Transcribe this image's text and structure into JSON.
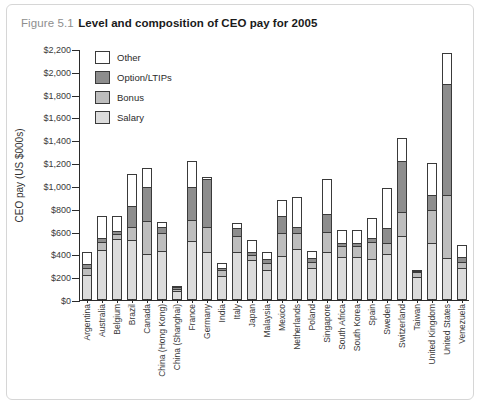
{
  "figure": {
    "number": "Figure 5.1",
    "title": "Level and composition of CEO pay for 2005"
  },
  "chart_data": {
    "type": "bar",
    "stacked": true,
    "title": "Level and composition of CEO pay for 2005",
    "xlabel": "",
    "ylabel": "CEO pay (US $000s)",
    "ylim": [
      0,
      2200
    ],
    "ytick_step": 200,
    "ytick_labels": [
      "$0",
      "$200",
      "$400",
      "$600",
      "$800",
      "$1,000",
      "$1,200",
      "$1,400",
      "$1,600",
      "$1,800",
      "$2,000",
      "$2,200"
    ],
    "grid": false,
    "legend_position": "top-left",
    "legend": [
      "Other",
      "Option/LTIPs",
      "Bonus",
      "Salary"
    ],
    "colors": {
      "Other": "#ffffff",
      "Option/LTIPs": "#8d8d8d",
      "Bonus": "#bdbdbd",
      "Salary": "#dcdcdc"
    },
    "categories": [
      "Argentina",
      "Australia",
      "Belgium",
      "Brazil",
      "Canada",
      "China (Hong Kong)",
      "China (Shanghai)",
      "France",
      "Germany",
      "India",
      "Italy",
      "Japan",
      "Malaysia",
      "Mexico",
      "Netherlands",
      "Poland",
      "Singapore",
      "South Africa",
      "South Korea",
      "Spain",
      "Sweden",
      "Switzerland",
      "Taiwan",
      "United Kingdom",
      "United States",
      "Venezuela"
    ],
    "series": [
      {
        "name": "Salary",
        "values": [
          205,
          420,
          520,
          505,
          385,
          415,
          60,
          500,
          405,
          190,
          400,
          335,
          245,
          365,
          430,
          265,
          400,
          360,
          360,
          345,
          385,
          540,
          185,
          480,
          350,
          260
        ]
      },
      {
        "name": "Bonus",
        "values": [
          55,
          75,
          45,
          115,
          290,
          155,
          20,
          185,
          220,
          55,
          145,
          40,
          60,
          205,
          140,
          50,
          180,
          95,
          95,
          145,
          100,
          210,
          45,
          295,
          550,
          60
        ]
      },
      {
        "name": "Option/LTIPs",
        "values": [
          40,
          35,
          25,
          185,
          300,
          50,
          20,
          290,
          415,
          20,
          70,
          25,
          35,
          150,
          55,
          40,
          160,
          25,
          25,
          35,
          130,
          455,
          10,
          130,
          980,
          40
        ]
      },
      {
        "name": "Other",
        "values": [
          100,
          190,
          130,
          285,
          165,
          50,
          5,
          225,
          25,
          45,
          45,
          110,
          60,
          140,
          260,
          60,
          305,
          120,
          120,
          175,
          350,
          195,
          10,
          275,
          265,
          105
        ]
      }
    ]
  }
}
